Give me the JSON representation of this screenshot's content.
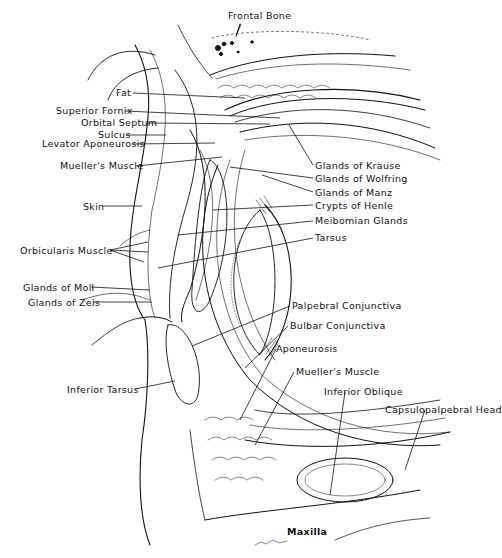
{
  "diagram": {
    "colors": {
      "ink": "#111111",
      "background": "#ffffff"
    },
    "labels": [
      {
        "id": "frontal-bone",
        "text": "Frontal Bone",
        "x": 228,
        "y": 14,
        "align": "left"
      },
      {
        "id": "fat",
        "text": "Fat",
        "x": 116,
        "y": 87,
        "align": "left"
      },
      {
        "id": "superior-fornix",
        "text": "Superior Fornix",
        "x": 56,
        "y": 105,
        "align": "left"
      },
      {
        "id": "orbital-septum",
        "text": "Orbital Septum",
        "x": 81,
        "y": 117,
        "align": "left"
      },
      {
        "id": "sulcus",
        "text": "Sulcus",
        "x": 98,
        "y": 129,
        "align": "left"
      },
      {
        "id": "levator-aponeurosis",
        "text": "Levator Aponeurosis",
        "x": 42,
        "y": 138,
        "align": "left"
      },
      {
        "id": "muellers-muscle-upper",
        "text": "Mueller's Muscle",
        "x": 60,
        "y": 160,
        "align": "left"
      },
      {
        "id": "glands-of-krause",
        "text": "Glands of Krause",
        "x": 315,
        "y": 160,
        "align": "left"
      },
      {
        "id": "glands-of-wolfring",
        "text": "Glands of Wolfring",
        "x": 315,
        "y": 173,
        "align": "left"
      },
      {
        "id": "glands-of-manz",
        "text": "Glands of Manz",
        "x": 315,
        "y": 187,
        "align": "left"
      },
      {
        "id": "crypts-of-henle",
        "text": "Crypts of Henle",
        "x": 315,
        "y": 201,
        "align": "left"
      },
      {
        "id": "skin",
        "text": "Skin",
        "x": 83,
        "y": 201,
        "align": "left"
      },
      {
        "id": "meibomian-glands",
        "text": "Meibomian Glands",
        "x": 315,
        "y": 216,
        "align": "left"
      },
      {
        "id": "orbicularis-muscle",
        "text": "Orbicularis Muscle",
        "x": 20,
        "y": 245,
        "align": "left"
      },
      {
        "id": "tarsus",
        "text": "Tarsus",
        "x": 315,
        "y": 233,
        "align": "left"
      },
      {
        "id": "glands-of-moll",
        "text": "Glands of Moll",
        "x": 23,
        "y": 282,
        "align": "left"
      },
      {
        "id": "glands-of-zeis",
        "text": "Glands of Zeis",
        "x": 28,
        "y": 297,
        "align": "left"
      },
      {
        "id": "palpebral-conjunctiva",
        "text": "Palpebral Conjunctiva",
        "x": 292,
        "y": 301,
        "align": "left"
      },
      {
        "id": "bulbar-conjunctiva",
        "text": "Bulbar Conjunctiva",
        "x": 290,
        "y": 321,
        "align": "left"
      },
      {
        "id": "aponeurosis",
        "text": "Aponeurosis",
        "x": 276,
        "y": 344,
        "align": "left"
      },
      {
        "id": "inferior-tarsus",
        "text": "Inferior Tarsus",
        "x": 67,
        "y": 384,
        "align": "left"
      },
      {
        "id": "muellers-muscle-lower",
        "text": "Mueller's Muscle",
        "x": 296,
        "y": 366,
        "align": "left"
      },
      {
        "id": "inferior-oblique",
        "text": "Inferior Oblique",
        "x": 324,
        "y": 386,
        "align": "left"
      },
      {
        "id": "capsulopalpebral-head",
        "text": "Capsulopalpebral Head",
        "x": 385,
        "y": 404,
        "align": "left"
      },
      {
        "id": "maxilla",
        "text": "Maxilla",
        "x": 287,
        "y": 526,
        "align": "left"
      }
    ]
  }
}
